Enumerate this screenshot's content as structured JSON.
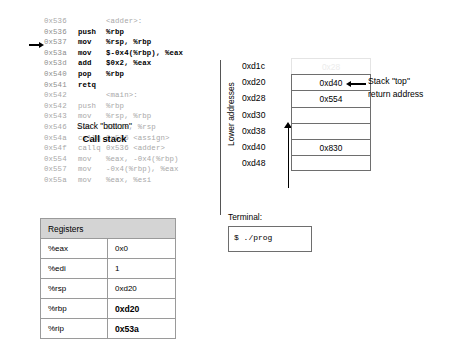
{
  "code": {
    "lines": [
      {
        "addr": "0x536",
        "mnem": "",
        "ops": "<adder>:",
        "style": "label"
      },
      {
        "addr": "0x536",
        "mnem": "push",
        "ops": "%rbp",
        "style": "active"
      },
      {
        "addr": "0x537",
        "mnem": "mov",
        "ops": "%rsp, %rbp",
        "style": "active"
      },
      {
        "addr": "0x53a",
        "mnem": "mov",
        "ops": "$-0x4(%rbp), %eax",
        "style": "active"
      },
      {
        "addr": "0x53d",
        "mnem": "add",
        "ops": "$0x2, %eax",
        "style": "active"
      },
      {
        "addr": "0x540",
        "mnem": "pop",
        "ops": "%rbp",
        "style": "active"
      },
      {
        "addr": "0x541",
        "mnem": "retq",
        "ops": "",
        "style": "active"
      },
      {
        "addr": "0x542",
        "mnem": "",
        "ops": "<main>:",
        "style": "label"
      },
      {
        "addr": "0x542",
        "mnem": "push",
        "ops": "%rbp",
        "style": "dim"
      },
      {
        "addr": "0x543",
        "mnem": "mov",
        "ops": "%rsp, %rbp",
        "style": "dim"
      },
      {
        "addr": "0x546",
        "mnem": "sub",
        "ops": "$0x10, %rsp",
        "style": "dim"
      },
      {
        "addr": "0x54a",
        "mnem": "callq",
        "ops": "0x526 <assign>",
        "style": "dim"
      },
      {
        "addr": "0x54f",
        "mnem": "callq",
        "ops": "0x536 <adder>",
        "style": "dim"
      },
      {
        "addr": "0x554",
        "mnem": "mov",
        "ops": "%eax, -0x4(%rbp)",
        "style": "dim"
      },
      {
        "addr": "0x557",
        "mnem": "mov",
        "ops": "-0x4(%rbp), %eax",
        "style": "dim"
      },
      {
        "addr": "0x55a",
        "mnem": "mov",
        "ops": "%eax, %esi",
        "style": "dim"
      }
    ],
    "instruction_pointer_addr": "0x537"
  },
  "registers": {
    "header": "Registers",
    "rows": [
      {
        "name": "%eax",
        "value": "0x0",
        "bold": false
      },
      {
        "name": "%edi",
        "value": "1",
        "bold": false
      },
      {
        "name": "%rsp",
        "value": "0xd20",
        "bold": false
      },
      {
        "name": "%rbp",
        "value": "0xd20",
        "bold": true
      },
      {
        "name": "%rip",
        "value": "0x53a",
        "bold": true
      }
    ]
  },
  "call_stack": {
    "axis_label": "Lower addresses",
    "addresses": [
      "0xd1c",
      "0xd20",
      "0xd28",
      "0xd30",
      "0xd38",
      "0xd40",
      "0xd48"
    ],
    "cells": [
      {
        "value": "0x28",
        "ghost": true
      },
      {
        "value": "0xd40",
        "ghost": false
      },
      {
        "value": "0x554",
        "ghost": false
      },
      {
        "value": "",
        "ghost": false
      },
      {
        "value": "",
        "ghost": false
      },
      {
        "value": "0x830",
        "ghost": false
      },
      {
        "value": "",
        "ghost": false
      }
    ],
    "top_annotation_line1": "Stack \"top\"",
    "top_annotation_line2": "return address",
    "bottom_caption": "Stack \"bottom\"",
    "title": "Call stack"
  },
  "terminal": {
    "label": "Terminal:",
    "line": "$ ./prog"
  }
}
